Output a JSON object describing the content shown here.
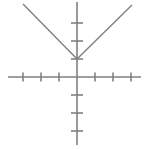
{
  "figure": {
    "width": 148,
    "height": 149,
    "background_color": "#ffffff",
    "line_color": "#808080",
    "axis_stroke_width": 1.6,
    "tick_stroke_width": 1.6,
    "ray_stroke_width": 1.4
  },
  "chart_data": {
    "type": "line",
    "title": "",
    "subtitle": "",
    "xlabel": "",
    "ylabel": "",
    "grid": false,
    "legend": null,
    "annotations": [],
    "axes": {
      "origin_px": {
        "x": 77,
        "y": 77
      },
      "unit_px": 18,
      "x_axis": {
        "start_px": 8,
        "end_px": 141,
        "y_px": 77,
        "tick_values": [
          -3,
          -2,
          -1,
          1,
          2,
          3
        ],
        "tick_positions_px": [
          23,
          41,
          59,
          95,
          113,
          131
        ],
        "tick_half_length_px": 4.5,
        "tick_labels": []
      },
      "y_axis": {
        "start_px": 2,
        "end_px": 145,
        "x_px": 77,
        "tick_values": [
          3,
          2,
          1,
          -1,
          -2,
          -3
        ],
        "tick_positions_px": [
          23,
          41,
          59,
          95,
          113,
          131
        ],
        "tick_half_length_px": 6,
        "tick_labels": []
      },
      "xlim": [
        -3.9,
        3.6
      ],
      "ylim": [
        -3.8,
        4.2
      ]
    },
    "series": [
      {
        "name": "absolute-value-v-graph",
        "shape": "v",
        "vertex_px": {
          "x": 77,
          "y": 59
        },
        "vertex_value": {
          "x": 0,
          "y": 1
        },
        "slope_left": -1,
        "slope_right": 1,
        "left_ray_end_px": {
          "x": 23,
          "y": 4
        },
        "right_ray_end_px": {
          "x": 132,
          "y": 5
        },
        "x": [
          -3,
          0,
          3
        ],
        "values": [
          4,
          1,
          4
        ],
        "color": "#808080"
      }
    ]
  }
}
